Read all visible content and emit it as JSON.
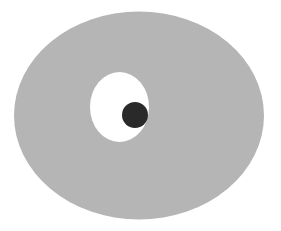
{
  "figure": {
    "width": 281,
    "height": 231,
    "background": "#ffffff",
    "shapes": {
      "outer_ellipse": {
        "cx": 139,
        "cy": 115.5,
        "rx": 125,
        "ry": 104,
        "fill": "#b5b5b5"
      },
      "inner_ellipse": {
        "cx": 119.5,
        "cy": 107,
        "rx": 29.5,
        "ry": 35,
        "fill": "#ffffff"
      },
      "dot": {
        "cx": 135,
        "cy": 115,
        "r": 13,
        "fill": "#2a2a2a"
      }
    }
  }
}
